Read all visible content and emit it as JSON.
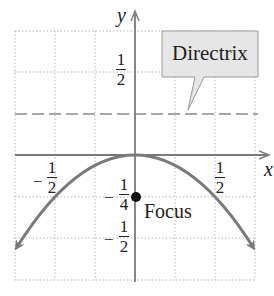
{
  "diagram": {
    "type": "parabola-graph",
    "equation": "x^2 = -y",
    "axes": {
      "x_label": "x",
      "y_label": "y"
    },
    "tick_labels": {
      "x_neg_half": {
        "sign": "−",
        "num": "1",
        "den": "2"
      },
      "x_pos_half": {
        "num": "1",
        "den": "2"
      },
      "y_pos_half": {
        "num": "1",
        "den": "2"
      },
      "y_neg_quarter": {
        "sign": "−",
        "num": "1",
        "den": "4"
      },
      "y_neg_half": {
        "sign": "−",
        "num": "1",
        "den": "2"
      }
    },
    "annotations": {
      "directrix_label": "Directrix",
      "focus_label": "Focus"
    },
    "key_points": {
      "vertex": [
        0,
        0
      ],
      "focus": [
        0,
        -0.25
      ],
      "directrix_y": 0.25
    },
    "colors": {
      "curve": "#7a7a7a",
      "axis": "#7a7a7a",
      "grid": "#b8b8b8",
      "directrix": "#8a8a8a",
      "callout_fill": "#e6e6e6",
      "callout_stroke": "#9a9a9a",
      "focus_dot": "#111111"
    }
  }
}
